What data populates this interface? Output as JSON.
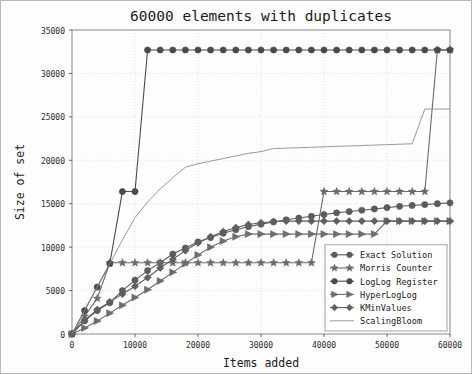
{
  "chart_data": {
    "type": "line",
    "title": "60000 elements with duplicates",
    "xlabel": "Items added",
    "ylabel": "Size of set",
    "xlim": [
      0,
      60000
    ],
    "ylim": [
      0,
      35000
    ],
    "xticks": [
      0,
      10000,
      20000,
      30000,
      40000,
      50000,
      60000
    ],
    "yticks": [
      0,
      5000,
      10000,
      15000,
      20000,
      25000,
      30000,
      35000
    ],
    "xtick_labels": [
      "0",
      "10000",
      "20000",
      "30000",
      "40000",
      "50000",
      "60000"
    ],
    "ytick_labels": [
      "0",
      "5000",
      "10000",
      "15000",
      "20000",
      "25000",
      "30000",
      "35000"
    ],
    "grid": true,
    "legend_position": "lower right",
    "series": [
      {
        "name": "Exact Solution",
        "marker": "circle",
        "color": "#5b5b5b",
        "x": [
          0,
          2000,
          4000,
          6000,
          8000,
          10000,
          12000,
          14000,
          16000,
          18000,
          20000,
          22000,
          24000,
          26000,
          28000,
          30000,
          32000,
          34000,
          36000,
          38000,
          40000,
          42000,
          44000,
          46000,
          48000,
          50000,
          52000,
          54000,
          56000,
          58000,
          60000
        ],
        "y": [
          0,
          1500,
          2700,
          3600,
          5000,
          6200,
          7300,
          8200,
          9200,
          9900,
          10600,
          11100,
          11600,
          12000,
          12350,
          12650,
          12900,
          13150,
          13350,
          13550,
          13750,
          13950,
          14100,
          14250,
          14400,
          14550,
          14700,
          14800,
          14900,
          15000,
          15100
        ]
      },
      {
        "name": "Morris Counter",
        "marker": "star",
        "color": "#6a6a6a",
        "x": [
          0,
          2000,
          4000,
          6000,
          8000,
          10000,
          12000,
          14000,
          16000,
          18000,
          20000,
          22000,
          24000,
          26000,
          28000,
          30000,
          32000,
          34000,
          36000,
          38000,
          40000,
          42000,
          44000,
          46000,
          48000,
          50000,
          52000,
          54000,
          56000,
          58000,
          60000
        ],
        "y": [
          0,
          2050,
          4100,
          8200,
          8200,
          8200,
          8200,
          8200,
          8200,
          8200,
          8200,
          8200,
          8200,
          8200,
          8200,
          8200,
          8200,
          8200,
          8200,
          8200,
          16400,
          16400,
          16400,
          16400,
          16400,
          16400,
          16400,
          16400,
          16400,
          32700,
          32700
        ]
      },
      {
        "name": "LogLog Register",
        "marker": "filled-circle",
        "color": "#4a4a4a",
        "x": [
          0,
          2000,
          4000,
          6000,
          8000,
          10000,
          12000,
          14000,
          16000,
          18000,
          20000,
          22000,
          24000,
          26000,
          28000,
          30000,
          32000,
          34000,
          36000,
          38000,
          40000,
          42000,
          44000,
          46000,
          48000,
          50000,
          52000,
          54000,
          56000,
          58000,
          60000
        ],
        "y": [
          0,
          2700,
          5400,
          8100,
          16400,
          16400,
          32700,
          32700,
          32700,
          32700,
          32700,
          32700,
          32700,
          32700,
          32700,
          32700,
          32700,
          32700,
          32700,
          32700,
          32700,
          32700,
          32700,
          32700,
          32700,
          32700,
          32700,
          32700,
          32700,
          32700,
          32700
        ]
      },
      {
        "name": "HyperLogLog",
        "marker": "triangle-right",
        "color": "#6d6d6d",
        "x": [
          0,
          2000,
          4000,
          6000,
          8000,
          10000,
          12000,
          14000,
          16000,
          18000,
          20000,
          22000,
          24000,
          26000,
          28000,
          30000,
          32000,
          34000,
          36000,
          38000,
          40000,
          42000,
          44000,
          46000,
          48000,
          50000,
          52000,
          54000,
          56000,
          58000,
          60000
        ],
        "y": [
          0,
          700,
          1500,
          2400,
          3300,
          4200,
          5100,
          6100,
          7100,
          8100,
          9100,
          10000,
          10700,
          11200,
          11500,
          11500,
          11500,
          11500,
          11500,
          11500,
          11500,
          11500,
          11500,
          11500,
          11500,
          13000,
          13000,
          13000,
          13000,
          13000,
          13000
        ]
      },
      {
        "name": "KMinValues",
        "marker": "diamond",
        "color": "#5f5f5f",
        "x": [
          0,
          2000,
          4000,
          6000,
          8000,
          10000,
          12000,
          14000,
          16000,
          18000,
          20000,
          22000,
          24000,
          26000,
          28000,
          30000,
          32000,
          34000,
          36000,
          38000,
          40000,
          42000,
          44000,
          46000,
          48000,
          50000,
          52000,
          54000,
          56000,
          58000,
          60000
        ],
        "y": [
          0,
          1600,
          2800,
          3700,
          4600,
          5500,
          6500,
          7600,
          8600,
          9600,
          10500,
          11200,
          11800,
          12250,
          12600,
          12800,
          12950,
          13000,
          13000,
          13000,
          13000,
          13000,
          13000,
          13000,
          13000,
          13000,
          13000,
          13000,
          13000,
          13000,
          13000
        ]
      },
      {
        "name": "ScalingBloom",
        "marker": "none",
        "color": "#8e8e8e",
        "x": [
          0,
          2000,
          4000,
          6000,
          8000,
          10000,
          12000,
          14000,
          16000,
          18000,
          20000,
          22000,
          24000,
          26000,
          28000,
          30000,
          32000,
          34000,
          36000,
          38000,
          40000,
          42000,
          44000,
          46000,
          48000,
          50000,
          52000,
          54000,
          56000,
          58000,
          60000
        ],
        "y": [
          0,
          2700,
          5400,
          8100,
          10800,
          13400,
          15200,
          16700,
          18000,
          19200,
          19600,
          19900,
          20200,
          20500,
          20800,
          21000,
          21350,
          21400,
          21450,
          21500,
          21550,
          21600,
          21650,
          21700,
          21750,
          21800,
          21850,
          21900,
          25900,
          25900,
          25900
        ]
      }
    ]
  },
  "legend": {
    "items": [
      {
        "label": "Exact Solution"
      },
      {
        "label": "Morris Counter"
      },
      {
        "label": "LogLog Register"
      },
      {
        "label": "HyperLogLog"
      },
      {
        "label": "KMinValues"
      },
      {
        "label": "ScalingBloom"
      }
    ]
  }
}
